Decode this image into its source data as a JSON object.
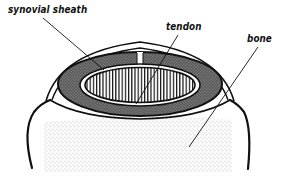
{
  "diagram": {
    "labels": {
      "synovial_sheath": "synovial sheath",
      "tendon": "tendon",
      "bone": "bone"
    },
    "colors": {
      "ink": "#111111",
      "sheath_fill": "#6e6e6e",
      "bone_stipple": "#9a9a9a",
      "background": "#ffffff"
    }
  }
}
